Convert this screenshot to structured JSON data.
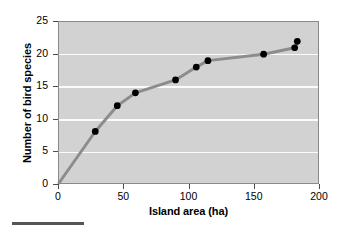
{
  "chart_data": {
    "type": "line",
    "title": "",
    "xlabel": "Island area (ha)",
    "ylabel": "Number of bird species",
    "xlim": [
      0,
      200
    ],
    "ylim": [
      0,
      25
    ],
    "xticks": [
      0,
      50,
      100,
      150,
      200
    ],
    "yticks": [
      0,
      5,
      10,
      15,
      20,
      25
    ],
    "grid": "horizontal",
    "legend": "none",
    "plot_background_color": "#d2d2d2",
    "gridline_color": "#fbfbfb",
    "line_color": "#8c8c8c",
    "marker_color": "#000000",
    "series": [
      {
        "name": "Bird species vs island area",
        "x": [
          0,
          28,
          45,
          59,
          90,
          106,
          115,
          158,
          182,
          184
        ],
        "y": [
          0,
          8,
          12,
          14,
          16,
          18,
          19,
          20,
          21,
          22
        ]
      }
    ]
  },
  "axes": {
    "x_tick_labels": [
      "0",
      "50",
      "100",
      "150",
      "200"
    ],
    "y_tick_labels": [
      "0",
      "5",
      "10",
      "15",
      "20",
      "25"
    ]
  }
}
